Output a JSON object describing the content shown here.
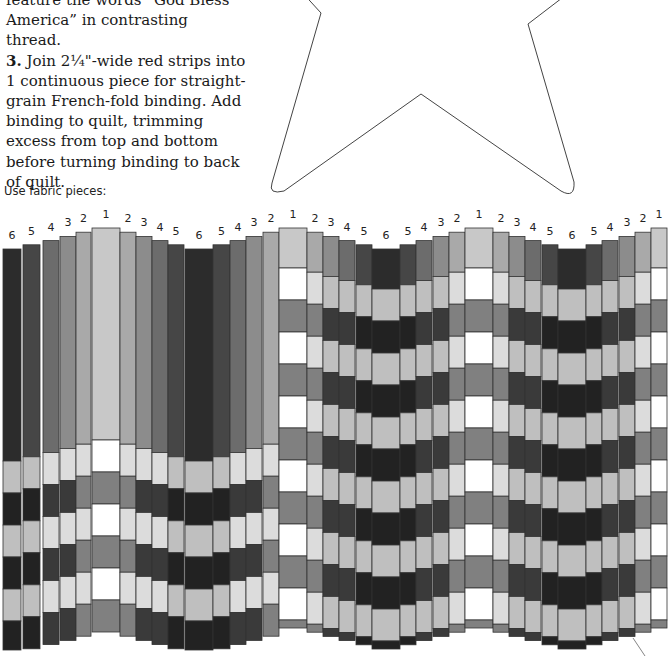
{
  "instructions": {
    "line_partial": "feature the words “God Bless",
    "line_america": "America” in contrasting thread.",
    "step3_number": "3.",
    "step3_text": " Join 2¼\"-wide red strips into 1 continuous piece for straight-grain French-fold binding. Add binding to quilt, trimming excess from top and bottom before turning binding to back of quilt."
  },
  "diagram": {
    "caption": "Use fabric pieces:",
    "colors": {
      "1": "#c8c8c8",
      "2": "#a9a9a9",
      "3": "#8c8c8c",
      "4": "#6c6c6c",
      "5": "#464646",
      "6": "#2c2c2c",
      "white": "#ffffff",
      "light": "#dcdcdc",
      "lightgray": "#bfbfbf",
      "mid": "#808080",
      "dark": "#3a3a3a",
      "darkest": "#222222"
    },
    "strip_labels": [
      "6",
      "5",
      "4",
      "3",
      "2",
      "1",
      "2",
      "3",
      "4",
      "5",
      "6",
      "5",
      "4",
      "3",
      "2",
      "1",
      "2",
      "3",
      "4",
      "5",
      "6",
      "5",
      "4",
      "3",
      "2",
      "1",
      "2",
      "3",
      "4",
      "5",
      "6",
      "5",
      "4",
      "3",
      "2",
      "1"
    ],
    "section1_note": "Strips labeled 6 through 1 through 6 shown as solid fabric columns before being cut into staggered rows",
    "section2_note": "Bargello pattern with repeating arcs of light and dark fabric"
  }
}
